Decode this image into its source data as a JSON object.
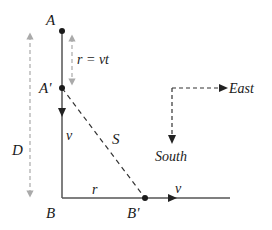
{
  "diagram": {
    "points": {
      "A": "A",
      "A_prime": "A'",
      "B": "B",
      "B_prime": "B'"
    },
    "labels": {
      "displacement": "r = vt",
      "distance": "D",
      "velocity_vertical": "v",
      "velocity_horizontal": "v",
      "horizontal_distance": "r",
      "separation": "S"
    },
    "compass": {
      "east": "East",
      "south": "South"
    },
    "colors": {
      "line": "#555555",
      "dashed_dim": "#aaaaaa",
      "dashed_dark": "#333333",
      "point": "#1a1a1a"
    }
  }
}
